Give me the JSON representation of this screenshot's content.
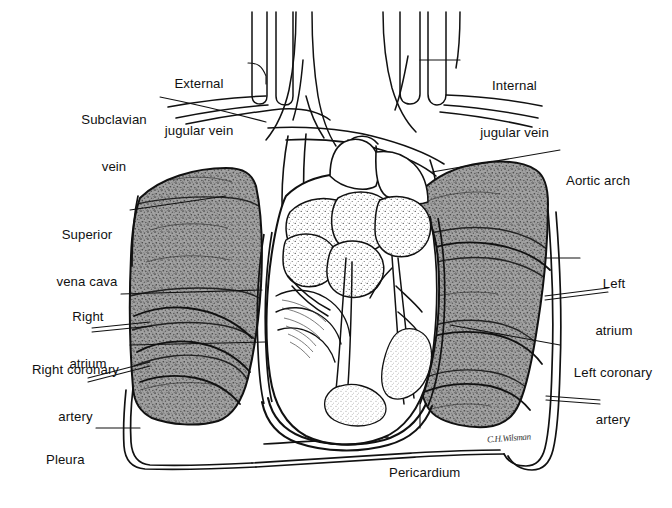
{
  "figure": {
    "signature": "C.H.Wilsman",
    "background_color": "#ffffff",
    "ink_color": "#111111",
    "lung_fill_color": "#9a9a9a",
    "stipple_color": "#5a5a5a"
  },
  "labels": [
    {
      "id": "external-jugular-vein",
      "text_lines": [
        "External",
        "jugular vein"
      ],
      "line1": "External",
      "line2": "jugular vein",
      "side": "left",
      "x": 152,
      "y": 45,
      "width": 94,
      "align": "center"
    },
    {
      "id": "subclavian-vein",
      "text_lines": [
        "Subclavian",
        "vein"
      ],
      "line1": "Subclavian",
      "line2": "vein",
      "side": "left",
      "x": 70,
      "y": 81,
      "width": 88,
      "align": "center"
    },
    {
      "id": "superior-vena-cava",
      "text_lines": [
        "Superior",
        "vena cava"
      ],
      "line1": "Superior",
      "line2": "vena cava",
      "side": "left",
      "x": 47,
      "y": 196,
      "width": 80,
      "align": "center"
    },
    {
      "id": "right-atrium",
      "text_lines": [
        "Right",
        "atrium"
      ],
      "line1": "Right",
      "line2": "atrium",
      "side": "left",
      "x": 58,
      "y": 278,
      "width": 60,
      "align": "center"
    },
    {
      "id": "right-coronary-artery",
      "text_lines": [
        "Right coronary",
        "artery"
      ],
      "line1": "Right coronary",
      "line2": "artery",
      "side": "left",
      "x": 26,
      "y": 331,
      "width": 99,
      "align": "center"
    },
    {
      "id": "pleura",
      "text_lines": [
        "Pleura"
      ],
      "line1": "Pleura",
      "line2": "",
      "side": "left",
      "x": 46,
      "y": 421,
      "width": 45,
      "align": "left"
    },
    {
      "id": "internal-jugular-vein",
      "text_lines": [
        "Internal",
        "jugular vein"
      ],
      "line1": "Internal",
      "line2": "jugular vein",
      "side": "right",
      "x": 468,
      "y": 47,
      "width": 93,
      "align": "center"
    },
    {
      "id": "aortic-arch",
      "text_lines": [
        "Aortic arch"
      ],
      "line1": "Aortic arch",
      "line2": "",
      "side": "right",
      "x": 566,
      "y": 142,
      "width": 76,
      "align": "left"
    },
    {
      "id": "left-atrium",
      "text_lines": [
        "Left",
        "atrium"
      ],
      "line1": "Left",
      "line2": "atrium",
      "side": "right",
      "x": 587,
      "y": 245,
      "width": 54,
      "align": "center"
    },
    {
      "id": "left-coronary-artery",
      "text_lines": [
        "Left coronary",
        "artery"
      ],
      "line1": "Left coronary",
      "line2": "artery",
      "side": "right",
      "x": 566,
      "y": 334,
      "width": 94,
      "align": "center"
    },
    {
      "id": "pericardium",
      "text_lines": [
        "Pericardium"
      ],
      "line1": "Pericardium",
      "line2": "",
      "side": "bottom",
      "x": 389,
      "y": 434,
      "width": 82,
      "align": "left"
    }
  ],
  "structures": [
    {
      "id": "right-lung",
      "name": "Right lung (viewer left)",
      "shaded": true
    },
    {
      "id": "left-lung",
      "name": "Left lung (viewer right)",
      "shaded": true
    },
    {
      "id": "heart",
      "name": "Heart",
      "shaded": false
    },
    {
      "id": "pericardial-sac",
      "name": "Pericardial sac",
      "shaded": false
    },
    {
      "id": "pleural-outline",
      "name": "Pleural outline",
      "shaded": false
    },
    {
      "id": "great-vessels",
      "name": "Great vessels of neck",
      "shaded": false
    }
  ]
}
